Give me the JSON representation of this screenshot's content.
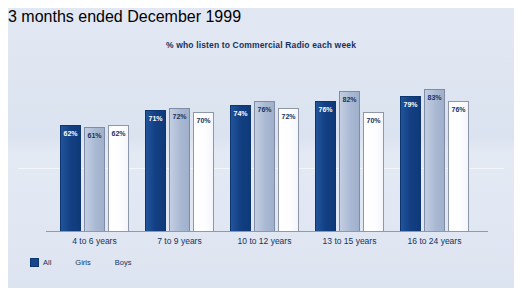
{
  "chart_data": {
    "type": "bar",
    "title": "% who listen to Commercial Radio each week",
    "xlabel": "",
    "ylabel": "",
    "ylim": [
      0,
      100
    ],
    "grid": false,
    "legend_position": "bottom-left",
    "categories": [
      "4 to 6 years",
      "7 to 9 years",
      "10 to 12 years",
      "13 to 15 years",
      "16 to 24 years"
    ],
    "series": [
      {
        "name": "All",
        "color": "#16468c",
        "values": [
          62,
          71,
          74,
          76,
          79
        ],
        "labels": [
          "62%",
          "71%",
          "74%",
          "76%",
          "79%"
        ]
      },
      {
        "name": "Girls",
        "color": "#b2c0d7",
        "values": [
          61,
          72,
          76,
          82,
          83
        ],
        "labels": [
          "61%",
          "72%",
          "76%",
          "82%",
          "83%"
        ]
      },
      {
        "name": "Boys",
        "color": "#ffffff",
        "values": [
          62,
          70,
          72,
          70,
          76
        ],
        "labels": [
          "62%",
          "70%",
          "72%",
          "70%",
          "76%"
        ]
      }
    ],
    "annotation": "3 months ended December 1999",
    "background_color": "#dee5f1"
  },
  "legend": {
    "items": [
      {
        "label": "All"
      },
      {
        "label": "Girls"
      },
      {
        "label": "Boys"
      }
    ]
  },
  "footnote": "3 months ended December 1999"
}
